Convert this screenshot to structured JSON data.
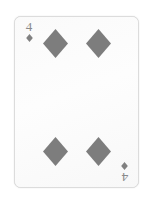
{
  "scene": {
    "background_color": "#ffffff",
    "description": "Playing card photograph, desaturated"
  },
  "card": {
    "name": "Four of Diamonds",
    "rank": "4",
    "suit": "diamonds",
    "suit_symbol": "♦",
    "face_color": "#fdfdfd",
    "border_color": "#dcdcdc",
    "pip_color": "#808080",
    "index_color": "#8a8a8a",
    "corner_indices": [
      {
        "position": "top-left",
        "rank": "4",
        "suit_symbol": "♦"
      },
      {
        "position": "bottom-right",
        "rank": "4",
        "suit_symbol": "♦"
      }
    ],
    "pips": {
      "count": 4,
      "layout": "2x2",
      "positions": [
        {
          "slot": "top-left"
        },
        {
          "slot": "top-right"
        },
        {
          "slot": "bottom-left"
        },
        {
          "slot": "bottom-right"
        }
      ]
    }
  }
}
